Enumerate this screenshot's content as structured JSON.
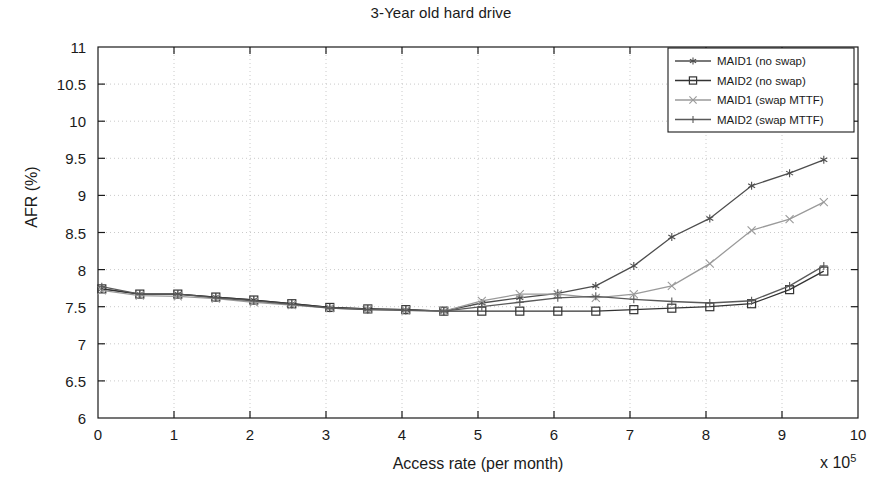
{
  "chart_data": {
    "type": "line",
    "title": "3-Year old hard drive",
    "xlabel": "Access rate (per month)",
    "ylabel": "AFR (%)",
    "x_multiplier": "x 10",
    "x_multiplier_exp": "5",
    "xlim": [
      0,
      10
    ],
    "ylim": [
      6,
      11
    ],
    "xticks": [
      0,
      1,
      2,
      3,
      4,
      5,
      6,
      7,
      8,
      9,
      10
    ],
    "yticks": [
      6,
      6.5,
      7,
      7.5,
      8,
      8.5,
      9,
      9.5,
      10,
      10.5,
      11
    ],
    "xtick_labels": [
      "0",
      "1",
      "2",
      "3",
      "4",
      "5",
      "6",
      "7",
      "8",
      "9",
      "10"
    ],
    "ytick_labels": [
      "6",
      "6.5",
      "7",
      "7.5",
      "8",
      "8.5",
      "9",
      "9.5",
      "10",
      "10.5",
      "11"
    ],
    "grid": true,
    "legend_position": "top-right",
    "x": [
      0.05,
      0.55,
      1.05,
      1.55,
      2.05,
      2.55,
      3.05,
      3.55,
      4.05,
      4.55,
      5.05,
      5.55,
      6.05,
      6.55,
      7.05,
      7.55,
      8.05,
      8.6,
      9.1,
      9.55
    ],
    "series": [
      {
        "name": "MAID1 (no swap)",
        "marker": "asterisk",
        "color": "#4d4d4d",
        "values": [
          7.74,
          7.67,
          7.67,
          7.63,
          7.59,
          7.54,
          7.49,
          7.47,
          7.46,
          7.44,
          7.55,
          7.62,
          7.68,
          7.78,
          8.05,
          8.44,
          8.69,
          9.13,
          9.3,
          9.48
        ]
      },
      {
        "name": "MAID2 (no swap)",
        "marker": "square",
        "color": "#333333",
        "values": [
          7.74,
          7.67,
          7.67,
          7.63,
          7.59,
          7.54,
          7.49,
          7.47,
          7.46,
          7.44,
          7.44,
          7.44,
          7.44,
          7.44,
          7.46,
          7.48,
          7.5,
          7.54,
          7.73,
          7.98
        ]
      },
      {
        "name": "MAID1 (swap MTTF)",
        "marker": "x",
        "color": "#9a9a9a",
        "values": [
          7.72,
          7.65,
          7.64,
          7.61,
          7.56,
          7.52,
          7.48,
          7.46,
          7.45,
          7.44,
          7.58,
          7.67,
          7.67,
          7.62,
          7.67,
          7.78,
          8.08,
          8.53,
          8.68,
          8.91
        ]
      },
      {
        "name": "MAID2 (swap MTTF)",
        "marker": "plus",
        "color": "#595959",
        "values": [
          7.77,
          7.67,
          7.67,
          7.62,
          7.58,
          7.53,
          7.48,
          7.46,
          7.45,
          7.44,
          7.5,
          7.56,
          7.62,
          7.64,
          7.6,
          7.57,
          7.55,
          7.58,
          7.78,
          8.05
        ]
      }
    ]
  }
}
